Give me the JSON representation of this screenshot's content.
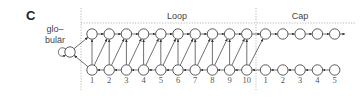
{
  "panel_label": "C",
  "globular_label": [
    "glo–",
    "bulär"
  ],
  "sections": [
    {
      "title": "Loop",
      "count": 10,
      "labels": [
        "1",
        "2",
        "3",
        "4",
        "5",
        "6",
        "7",
        "8",
        "9",
        "10"
      ]
    },
    {
      "title": "Cap",
      "count": 5,
      "labels": [
        "1",
        "2",
        "3",
        "4",
        "5"
      ]
    }
  ],
  "colors": {
    "stroke": "#333333",
    "text": "#444444",
    "divider": "#999999"
  }
}
